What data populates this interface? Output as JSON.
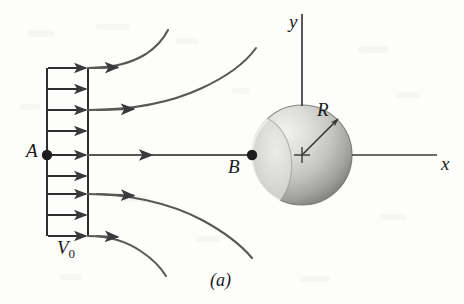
{
  "figure": {
    "caption": "(a)",
    "background_color": "#fdfdfc",
    "ink_color": "#3a3a3a"
  },
  "labels": {
    "point_a": "A",
    "point_b": "B",
    "radius": "R",
    "velocity": "V",
    "velocity_subscript": "0",
    "axis_x": "x",
    "axis_y": "y"
  },
  "axes": {
    "x_axis": {
      "label": "x",
      "y_pixel": 155,
      "from_x": 352,
      "to_x": 437
    },
    "y_axis": {
      "label": "y",
      "x_pixel": 302,
      "from_y": 14,
      "to_y": 105
    }
  },
  "sphere": {
    "center_x": 302,
    "center_y": 155,
    "radius": 50,
    "fill_light": "#e8e8e6",
    "fill_mid": "#c9c9c6",
    "fill_dark": "#8f8f8c",
    "center_mark": "cross",
    "radius_arrow_angle_deg": 45
  },
  "velocity_profile": {
    "label": "V0",
    "left_edge_x": 47,
    "right_edge_x": 88,
    "top_y": 68,
    "bottom_y": 236,
    "arrow_count": 9,
    "arrow_rows_y": [
      68,
      89,
      110,
      131,
      155,
      176,
      194,
      215,
      236
    ]
  },
  "points": {
    "a": {
      "x": 47,
      "y": 155,
      "marker": "filled-dot"
    },
    "b": {
      "x": 252,
      "y": 155,
      "marker": "filled-dot"
    }
  },
  "streamlines": [
    {
      "name": "upper-outer",
      "curves_away": "up"
    },
    {
      "name": "upper-inner",
      "curves_away": "up"
    },
    {
      "name": "stagnation-axis",
      "curves_away": "none"
    },
    {
      "name": "lower-inner",
      "curves_away": "down"
    },
    {
      "name": "lower-outer",
      "curves_away": "down"
    }
  ]
}
